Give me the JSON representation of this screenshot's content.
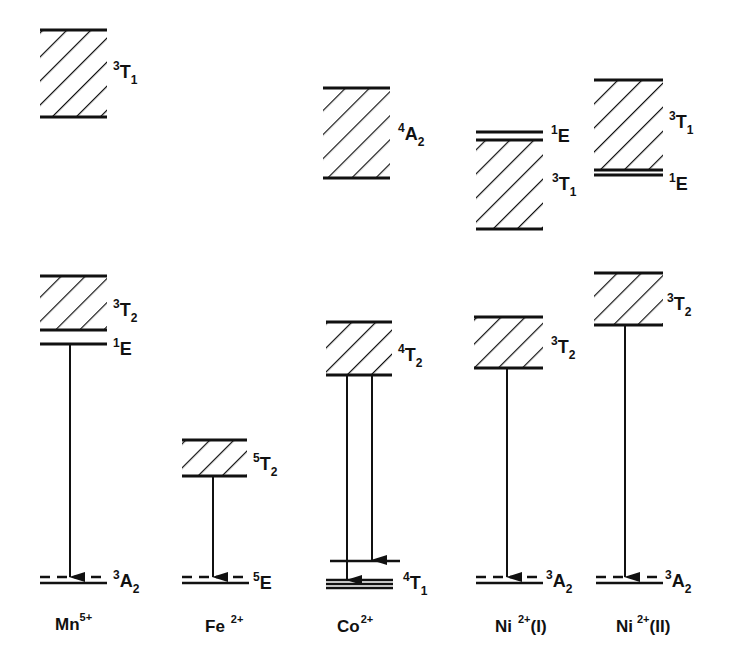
{
  "diagram": {
    "type": "energy-level-diagram",
    "ions": [
      {
        "name": "Mn5+",
        "label": "Mn",
        "charge": "5+",
        "suffix": "",
        "levels": [
          {
            "term": "3T1",
            "sup": "3",
            "main": "T",
            "sub": "1",
            "kind": "band",
            "top": 30,
            "bottom": 117
          },
          {
            "term": "3T2",
            "sup": "3",
            "main": "T",
            "sub": "2",
            "kind": "band",
            "top": 276,
            "bottom": 330
          },
          {
            "term": "1E",
            "sup": "1",
            "main": "E",
            "sub": "",
            "kind": "line",
            "y": 344
          },
          {
            "term": "3A2",
            "sup": "3",
            "main": "A",
            "sub": "2",
            "kind": "ground",
            "y": 578
          }
        ],
        "transitions": [
          {
            "from": "1E",
            "to": "3A2"
          }
        ]
      },
      {
        "name": "Fe2+",
        "label": "Fe",
        "charge": "2+",
        "suffix": "",
        "levels": [
          {
            "term": "5T2",
            "sup": "5",
            "main": "T",
            "sub": "2",
            "kind": "band",
            "top": 440,
            "bottom": 476
          },
          {
            "term": "5E",
            "sup": "5",
            "main": "E",
            "sub": "",
            "kind": "ground",
            "y": 578
          }
        ],
        "transitions": [
          {
            "from": "5T2",
            "to": "5E"
          }
        ]
      },
      {
        "name": "Co2+",
        "label": "Co",
        "charge": "2+",
        "suffix": "",
        "levels": [
          {
            "term": "4A2",
            "sup": "4",
            "main": "A",
            "sub": "2",
            "kind": "band",
            "top": 88,
            "bottom": 178
          },
          {
            "term": "4T2",
            "sup": "4",
            "main": "T",
            "sub": "2",
            "kind": "band",
            "top": 322,
            "bottom": 375
          },
          {
            "term": "4T1",
            "sup": "4",
            "main": "T",
            "sub": "1",
            "kind": "ground-split",
            "y": 581
          }
        ],
        "transitions": [
          {
            "from": "4T2",
            "to": "4T1 (lower)"
          },
          {
            "from": "4T2",
            "to": "4T1 (upper split)"
          }
        ]
      },
      {
        "name": "Ni2+(I)",
        "label": "Ni",
        "charge": "2+",
        "suffix": "(I)",
        "levels": [
          {
            "term": "1E",
            "sup": "1",
            "main": "E",
            "sub": "",
            "kind": "line",
            "y": 131
          },
          {
            "term": "3T1",
            "sup": "3",
            "main": "T",
            "sub": "1",
            "kind": "band",
            "top": 140,
            "bottom": 229
          },
          {
            "term": "3T2",
            "sup": "3",
            "main": "T",
            "sub": "2",
            "kind": "band",
            "top": 317,
            "bottom": 368
          },
          {
            "term": "3A2",
            "sup": "3",
            "main": "A",
            "sub": "2",
            "kind": "ground",
            "y": 578
          }
        ],
        "transitions": [
          {
            "from": "3T2",
            "to": "3A2"
          }
        ]
      },
      {
        "name": "Ni2+(II)",
        "label": "Ni",
        "charge": "2+",
        "suffix": "(II)",
        "levels": [
          {
            "term": "3T1",
            "sup": "3",
            "main": "T",
            "sub": "1",
            "kind": "band",
            "top": 80,
            "bottom": 170
          },
          {
            "term": "1E",
            "sup": "1",
            "main": "E",
            "sub": "",
            "kind": "line",
            "y": 175
          },
          {
            "term": "3T2",
            "sup": "3",
            "main": "T",
            "sub": "2",
            "kind": "band",
            "top": 273,
            "bottom": 325
          },
          {
            "term": "3A2",
            "sup": "3",
            "main": "A",
            "sub": "2",
            "kind": "ground",
            "y": 578
          }
        ],
        "transitions": [
          {
            "from": "3T2",
            "to": "3A2"
          }
        ]
      }
    ]
  },
  "labels": {
    "mn": {
      "el": "Mn",
      "charge": "5+"
    },
    "fe": {
      "el": "Fe",
      "charge": "2+"
    },
    "co": {
      "el": "Co",
      "charge": "2+"
    },
    "ni1": {
      "el": "Ni",
      "charge": "2+",
      "suffix": "(I)"
    },
    "ni2": {
      "el": "Ni",
      "charge": "2+",
      "suffix": "(II)"
    }
  },
  "terms": {
    "mn_t1": {
      "sup": "3",
      "main": "T",
      "sub": "1"
    },
    "mn_t2": {
      "sup": "3",
      "main": "T",
      "sub": "2"
    },
    "mn_e": {
      "sup": "1",
      "main": "E"
    },
    "mn_a2": {
      "sup": "3",
      "main": "A",
      "sub": "2"
    },
    "fe_t2": {
      "sup": "5",
      "main": "T",
      "sub": "2"
    },
    "fe_e": {
      "sup": "5",
      "main": "E"
    },
    "co_a2": {
      "sup": "4",
      "main": "A",
      "sub": "2"
    },
    "co_t2": {
      "sup": "4",
      "main": "T",
      "sub": "2"
    },
    "co_t1": {
      "sup": "4",
      "main": "T",
      "sub": "1"
    },
    "ni1_e": {
      "sup": "1",
      "main": "E"
    },
    "ni1_t1": {
      "sup": "3",
      "main": "T",
      "sub": "1"
    },
    "ni1_t2": {
      "sup": "3",
      "main": "T",
      "sub": "2"
    },
    "ni1_a2": {
      "sup": "3",
      "main": "A",
      "sub": "2"
    },
    "ni2_t1": {
      "sup": "3",
      "main": "T",
      "sub": "1"
    },
    "ni2_e": {
      "sup": "1",
      "main": "E"
    },
    "ni2_t2": {
      "sup": "3",
      "main": "T",
      "sub": "2"
    },
    "ni2_a2": {
      "sup": "3",
      "main": "A",
      "sub": "2"
    }
  },
  "colors": {
    "ink": "#111111",
    "background": "#ffffff"
  }
}
